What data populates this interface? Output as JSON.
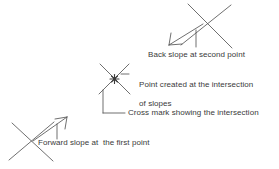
{
  "diagram": {
    "stroke_color": "#555555",
    "text_color": "#3a3a3a",
    "background": "#ffffff",
    "annotations": {
      "back_slope": "Back slope at second point",
      "point_created_line1": "Point created at the intersection",
      "point_created_line2": "of slopes",
      "cross_mark": "Cross mark showing the intersection",
      "forward_slope": "Forward slope at  the first point"
    },
    "marks": [
      {
        "name": "cross-mark-second-point",
        "cx": 204,
        "cy": 22
      },
      {
        "name": "cross-mark-intersection",
        "cx": 114,
        "cy": 79
      },
      {
        "name": "cross-mark-first-point",
        "cx": 30,
        "cy": 140
      }
    ]
  }
}
